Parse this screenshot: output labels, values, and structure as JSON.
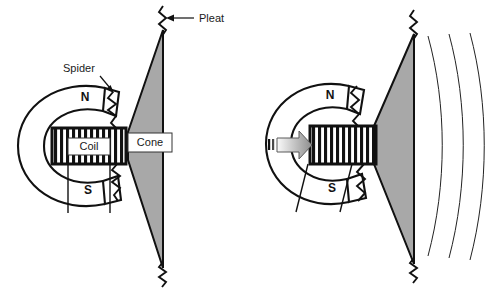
{
  "figure": {
    "background_color": "#ffffff",
    "ink_color": "#111111",
    "cone_fill_color": "#a8a8a8",
    "coil_stripe_color": "#111111",
    "arrow_fill_light": "#f2f2f2",
    "arrow_fill_dark": "#8d8d8d",
    "width": 501,
    "height": 290
  },
  "callouts": [
    {
      "id": "pleat",
      "label": "Pleat",
      "x": 200,
      "y": 18,
      "arrow": "left"
    },
    {
      "id": "spider",
      "label": "Spider",
      "x": 63,
      "y": 72,
      "arrow": "down-right"
    }
  ],
  "panels": [
    {
      "id": "panel-rest",
      "name": "rest-position",
      "magnet": {
        "north_label": "N",
        "south_label": "S"
      },
      "parts": [
        {
          "id": "coil",
          "label": "Coil",
          "boxed": true
        },
        {
          "id": "cone",
          "label": "Cone",
          "boxed": true
        }
      ],
      "lead_wires": 2,
      "pleats": 2,
      "sound_waves": 0,
      "drive_arrow": false
    },
    {
      "id": "panel-driven",
      "name": "driven-position",
      "magnet": {
        "north_label": "N",
        "south_label": "S"
      },
      "parts": [
        {
          "id": "coil",
          "label": "",
          "boxed": false
        },
        {
          "id": "cone",
          "label": "",
          "boxed": false
        }
      ],
      "lead_wires": 2,
      "pleats": 2,
      "sound_waves": 3,
      "drive_arrow": true
    }
  ],
  "legend_terms": {
    "north_pole": "N",
    "south_pole": "S",
    "coil": "Coil",
    "cone": "Cone",
    "spider": "Spider",
    "pleat": "Pleat"
  }
}
